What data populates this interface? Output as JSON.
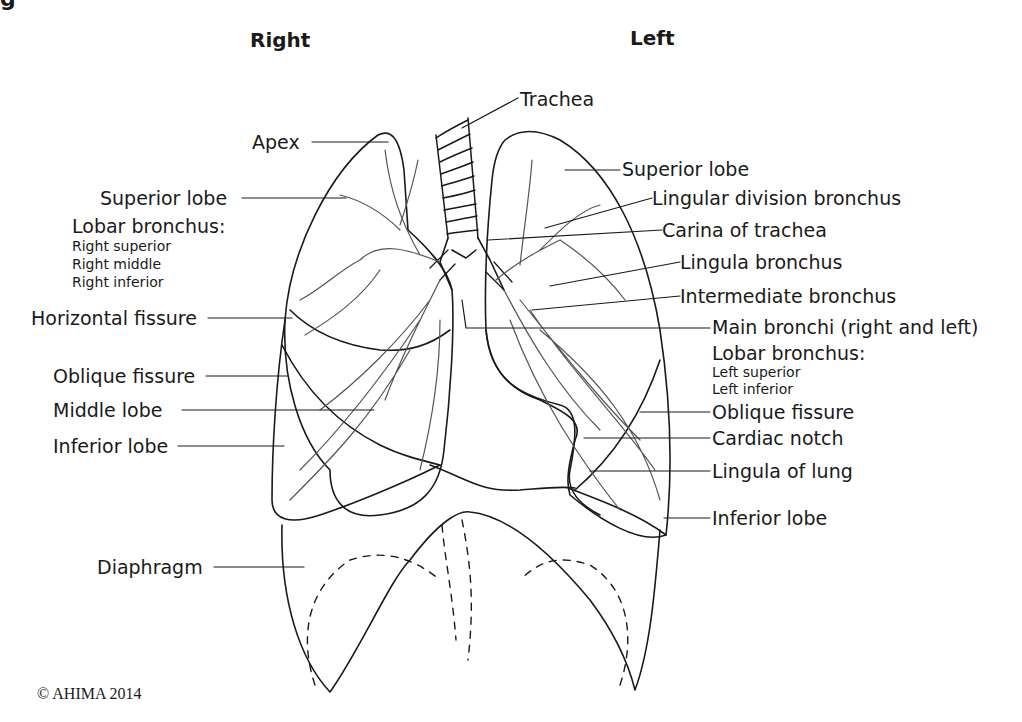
{
  "figure": {
    "cropped_title_fragment": "g",
    "side_labels": {
      "right": "Right",
      "left": "Left"
    },
    "copyright": "© AHIMA 2014"
  },
  "labels_right_side": {
    "apex": "Apex",
    "superior_lobe": "Superior lobe",
    "lobar_bronchus_heading": "Lobar bronchus:",
    "lobar_bronchus_items": [
      "Right superior",
      "Right middle",
      "Right inferior"
    ],
    "horizontal_fissure": "Horizontal fissure",
    "oblique_fissure": "Oblique fissure",
    "middle_lobe": "Middle lobe",
    "inferior_lobe": "Inferior lobe",
    "diaphragm": "Diaphragm"
  },
  "labels_left_side": {
    "trachea": "Trachea",
    "superior_lobe": "Superior lobe",
    "lingular_division_bronchus": "Lingular division bronchus",
    "carina_of_trachea": "Carina of trachea",
    "lingula_bronchus": "Lingula bronchus",
    "intermediate_bronchus": "Intermediate bronchus",
    "main_bronchi": "Main bronchi (right and left)",
    "lobar_bronchus_heading": "Lobar bronchus:",
    "lobar_bronchus_items": [
      "Left superior",
      "Left inferior"
    ],
    "oblique_fissure": "Oblique fissure",
    "cardiac_notch": "Cardiac notch",
    "lingula_of_lung": "Lingula of lung",
    "inferior_lobe": "Inferior lobe"
  },
  "colors": {
    "line": "#1a1a1a",
    "bronchi": "#555555",
    "background": "#ffffff"
  }
}
